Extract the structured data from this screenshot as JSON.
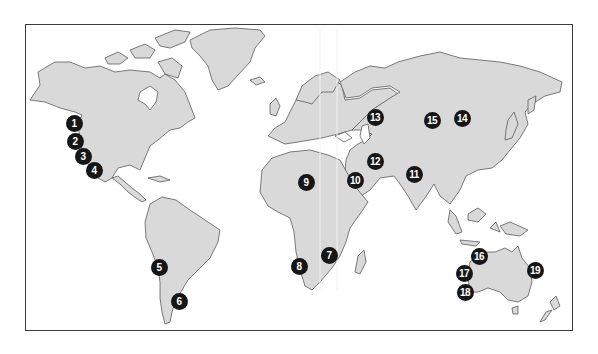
{
  "map": {
    "type": "world-map",
    "land_color": "#d9d9d9",
    "outline_color": "#5a5a5a",
    "marker_color": "#161616",
    "marker_text_color": "#ffffff",
    "markers": [
      {
        "label": "1",
        "region": "north-america-west-coast",
        "x": 74,
        "y": 123
      },
      {
        "label": "2",
        "region": "north-america-west-coast",
        "x": 75,
        "y": 141
      },
      {
        "label": "3",
        "region": "north-america-west-coast",
        "x": 83,
        "y": 156
      },
      {
        "label": "4",
        "region": "north-america-west-coast",
        "x": 94,
        "y": 170
      },
      {
        "label": "5",
        "region": "south-america-west-coast",
        "x": 159,
        "y": 267
      },
      {
        "label": "6",
        "region": "south-america-south",
        "x": 179,
        "y": 301
      },
      {
        "label": "7",
        "region": "southern-africa-east",
        "x": 329,
        "y": 255
      },
      {
        "label": "8",
        "region": "southern-africa-west",
        "x": 299,
        "y": 266
      },
      {
        "label": "9",
        "region": "north-africa",
        "x": 306,
        "y": 182
      },
      {
        "label": "10",
        "region": "arabian-peninsula",
        "x": 355,
        "y": 180
      },
      {
        "label": "11",
        "region": "india",
        "x": 414,
        "y": 174
      },
      {
        "label": "12",
        "region": "middle-east",
        "x": 375,
        "y": 161
      },
      {
        "label": "13",
        "region": "central-asia",
        "x": 375,
        "y": 117
      },
      {
        "label": "14",
        "region": "siberia-east",
        "x": 462,
        "y": 118
      },
      {
        "label": "15",
        "region": "siberia-central",
        "x": 432,
        "y": 120
      },
      {
        "label": "16",
        "region": "australia-north-west",
        "x": 479,
        "y": 256
      },
      {
        "label": "17",
        "region": "australia-west",
        "x": 464,
        "y": 273
      },
      {
        "label": "18",
        "region": "australia-south-west",
        "x": 465,
        "y": 292
      },
      {
        "label": "19",
        "region": "australia-east",
        "x": 535,
        "y": 270
      }
    ]
  }
}
